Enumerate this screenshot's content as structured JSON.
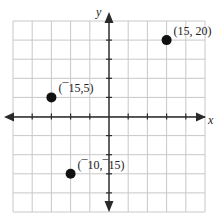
{
  "chart_data": {
    "type": "scatter",
    "title": "",
    "xlabel": "x",
    "ylabel": "y",
    "xlim": [
      -25,
      25
    ],
    "ylim": [
      -25,
      25
    ],
    "grid": true,
    "grid_step": 5,
    "tick_labels_shown": false,
    "series": [
      {
        "name": "points",
        "points": [
          {
            "x": 15,
            "y": 20,
            "label": "(15, 20)"
          },
          {
            "x": -15,
            "y": 5,
            "label": "(¯15,5)"
          },
          {
            "x": -10,
            "y": -15,
            "label": "(¯10,¯15)"
          }
        ]
      }
    ]
  },
  "axes": {
    "x_label": "x",
    "y_label": "y"
  },
  "colors": {
    "grid": "#c8c8c8",
    "axis": "#2a2a2a",
    "point": "#111111"
  }
}
